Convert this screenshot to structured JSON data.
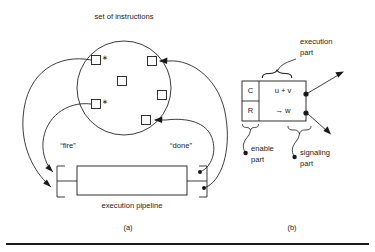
{
  "figure": {
    "background_color": "#ffffff",
    "ink_color": "#1a1a1a",
    "panels": [
      {
        "id": "a",
        "caption": "(a)",
        "labels": {
          "set_of_instructions": "set of instructions",
          "fire": "“fire”",
          "done": "“done”",
          "execution_pipeline": "execution pipeline"
        },
        "instruction_markers": [
          {
            "id": "instr-1",
            "x": 96,
            "y": 60,
            "starred": true,
            "star": "∗"
          },
          {
            "id": "instr-2",
            "x": 96,
            "y": 104,
            "starred": true,
            "star": "∗"
          },
          {
            "id": "instr-3",
            "x": 122,
            "y": 81,
            "starred": false,
            "star": ""
          },
          {
            "id": "instr-4",
            "x": 152,
            "y": 61,
            "starred": false,
            "star": ""
          },
          {
            "id": "instr-5",
            "x": 162,
            "y": 95,
            "starred": false,
            "star": ""
          },
          {
            "id": "instr-6",
            "x": 146,
            "y": 120,
            "starred": false,
            "star": ""
          }
        ],
        "instruction_set_circle": {
          "cx": 124,
          "cy": 88,
          "r": 47
        },
        "pipeline_box": {
          "x": 77,
          "y": 166,
          "width": 110,
          "height": 29
        }
      },
      {
        "id": "b",
        "caption": "(b)",
        "labels": {
          "execution_part": {
            "line1": "execution",
            "line2": "part"
          },
          "enable_part": {
            "line1": "enable",
            "line2": "part"
          },
          "signaling_part": {
            "line1": "signaling",
            "line2": "part"
          }
        },
        "cells": {
          "control_top": "C",
          "control_bottom": "R",
          "operation_top": "u + v",
          "operation_bottom": "→ w"
        },
        "instruction_box": {
          "x": 242,
          "y": 81,
          "width": 64,
          "height": 40,
          "divider_x": 259,
          "divider_y": 101
        }
      }
    ]
  }
}
